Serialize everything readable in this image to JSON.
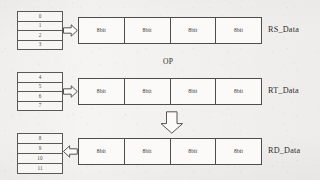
{
  "diagram": {
    "operation_label": "OP",
    "cell_label": "8bit",
    "colors": {
      "page_background": "#f5f4f2",
      "box_fill": "#fbfaf9",
      "table_fill": "#f7f6f4",
      "border": "#4f4d4a",
      "table_border": "#5b5956",
      "text": "#2e2c2b"
    },
    "rows": [
      {
        "id": "rs",
        "bus_label": "RS_Data",
        "register_indices": [
          "0",
          "1",
          "2",
          "3"
        ],
        "lanes": [
          "8bit",
          "8bit",
          "8bit",
          "8bit"
        ],
        "connector_icon": "arrow-right-icon",
        "connector_direction": "right"
      },
      {
        "id": "rt",
        "bus_label": "RT_Data",
        "register_indices": [
          "4",
          "5",
          "6",
          "7"
        ],
        "lanes": [
          "8bit",
          "8bit",
          "8bit",
          "8bit"
        ],
        "connector_icon": "arrow-right-icon",
        "connector_direction": "right"
      },
      {
        "id": "rd",
        "bus_label": "RD_Data",
        "register_indices": [
          "8",
          "9",
          "10",
          "11"
        ],
        "lanes": [
          "8bit",
          "8bit",
          "8bit",
          "8bit"
        ],
        "connector_icon": "arrow-left-icon",
        "connector_direction": "left"
      }
    ],
    "result_flow": {
      "icon": "arrow-down-icon",
      "direction": "down"
    }
  }
}
